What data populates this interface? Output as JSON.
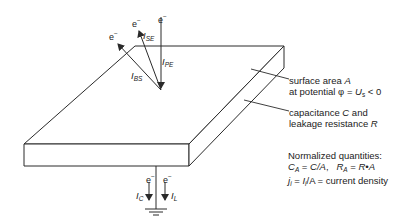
{
  "diagram": {
    "type": "schematic",
    "electron_symbol": "e",
    "electron_superscript": "−",
    "currents": {
      "backscatter": {
        "symbol": "I",
        "subscript": "BS"
      },
      "secondary": {
        "symbol": "I",
        "subscript": "SE"
      },
      "primary": {
        "symbol": "I",
        "subscript": "PE"
      },
      "capacitive": {
        "symbol": "I",
        "subscript": "C"
      },
      "leakage": {
        "symbol": "I",
        "subscript": "L"
      }
    },
    "annotations": {
      "surface": {
        "line1_text": "surface area ",
        "line1_var": "A",
        "line2_text": "at potential φ = ",
        "line2_var": "U",
        "line2_sub": "s",
        "line2_tail": " < 0"
      },
      "capacitance": {
        "line1_text": "capacitance ",
        "line1_var": "C",
        "line1_tail": " and",
        "line2_text": "leakage resistance ",
        "line2_var": "R"
      },
      "normalized": {
        "title": "Normalized quantities:",
        "line2": {
          "c_var": "C",
          "c_sub": "A",
          "c_eq": " = ",
          "c_expr": "C/A",
          "sep": ",   ",
          "r_var": "R",
          "r_sub": "A",
          "r_eq": " = ",
          "r_expr": "R•A"
        },
        "line3": {
          "j_var": "j",
          "j_sub": "i",
          "eq": " = ",
          "i_var": "I",
          "i_sub": "i",
          "tail": "/A = current density"
        }
      }
    },
    "colors": {
      "stroke": "#2a2a2a",
      "text": "#222222",
      "background": "#ffffff"
    }
  }
}
